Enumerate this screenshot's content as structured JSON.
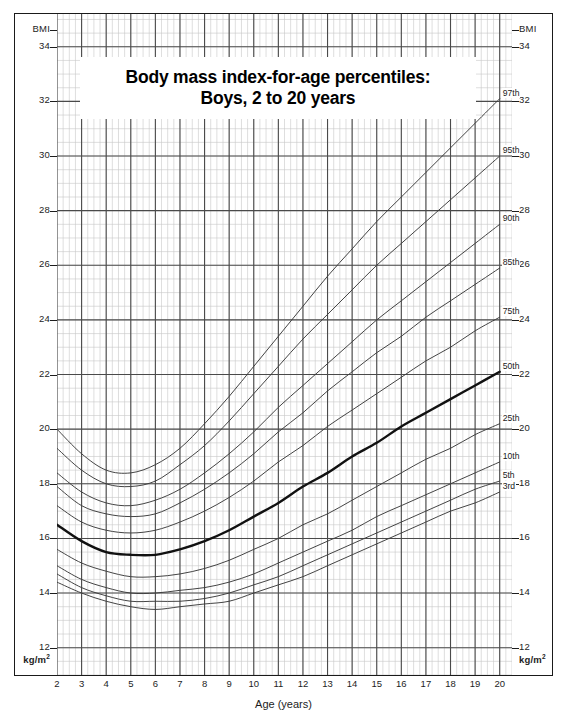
{
  "title": {
    "line1": "Body mass index-for-age percentiles:",
    "line2": "Boys, 2 to 20 years"
  },
  "axes": {
    "y_header_left": "BMI",
    "y_header_right": "BMI",
    "y_unit_left": "kg/m",
    "y_unit_right": "kg/m",
    "y_unit_sup": "2",
    "x_title": "Age (years)"
  },
  "chart_data": {
    "type": "line",
    "title": "Body mass index-for-age percentiles: Boys, 2 to 20 years",
    "xlabel": "Age (years)",
    "ylabel": "BMI",
    "yunit": "kg/m2",
    "xlim": [
      2,
      20.5
    ],
    "ylim": [
      11,
      35.2
    ],
    "xticks": [
      2,
      3,
      4,
      5,
      6,
      7,
      8,
      9,
      10,
      11,
      12,
      13,
      14,
      15,
      16,
      17,
      18,
      19,
      20
    ],
    "yticks": [
      12,
      14,
      16,
      18,
      20,
      22,
      24,
      26,
      28,
      30,
      32,
      34
    ],
    "grid": true,
    "grid_major_x": 1,
    "grid_minor_x": 0.25,
    "grid_major_y": 2,
    "grid_minor_y": 0.5,
    "legend_position": "right-inline",
    "x": [
      2,
      3,
      4,
      5,
      6,
      7,
      8,
      9,
      10,
      11,
      12,
      13,
      14,
      15,
      16,
      17,
      18,
      19,
      20
    ],
    "series": [
      {
        "name": "97th",
        "emphasis": false,
        "values": [
          20.0,
          19.1,
          18.5,
          18.4,
          18.7,
          19.3,
          20.2,
          21.2,
          22.3,
          23.4,
          24.5,
          25.6,
          26.6,
          27.6,
          28.5,
          29.4,
          30.3,
          31.2,
          32.1
        ]
      },
      {
        "name": "95th",
        "emphasis": false,
        "values": [
          19.3,
          18.5,
          18.0,
          17.9,
          18.1,
          18.7,
          19.4,
          20.3,
          21.3,
          22.3,
          23.3,
          24.2,
          25.1,
          26.0,
          26.8,
          27.6,
          28.4,
          29.2,
          30.0
        ]
      },
      {
        "name": "90th",
        "emphasis": false,
        "values": [
          18.4,
          17.7,
          17.3,
          17.2,
          17.4,
          17.8,
          18.4,
          19.1,
          19.9,
          20.8,
          21.6,
          22.4,
          23.2,
          24.0,
          24.7,
          25.4,
          26.1,
          26.8,
          27.5
        ]
      },
      {
        "name": "85th",
        "emphasis": false,
        "values": [
          17.9,
          17.2,
          16.9,
          16.8,
          16.9,
          17.3,
          17.8,
          18.4,
          19.1,
          19.9,
          20.6,
          21.4,
          22.1,
          22.8,
          23.4,
          24.1,
          24.7,
          25.3,
          25.9
        ]
      },
      {
        "name": "75th",
        "emphasis": false,
        "values": [
          17.2,
          16.6,
          16.3,
          16.2,
          16.3,
          16.6,
          17.0,
          17.5,
          18.1,
          18.8,
          19.4,
          20.1,
          20.7,
          21.3,
          21.9,
          22.5,
          23.0,
          23.6,
          24.1
        ]
      },
      {
        "name": "50th",
        "emphasis": true,
        "values": [
          16.5,
          15.9,
          15.5,
          15.4,
          15.4,
          15.6,
          15.9,
          16.3,
          16.8,
          17.3,
          17.9,
          18.4,
          19.0,
          19.5,
          20.1,
          20.6,
          21.1,
          21.6,
          22.1
        ]
      },
      {
        "name": "25th",
        "emphasis": false,
        "values": [
          15.6,
          15.1,
          14.8,
          14.6,
          14.6,
          14.7,
          14.9,
          15.2,
          15.6,
          16.0,
          16.5,
          16.9,
          17.4,
          17.9,
          18.4,
          18.9,
          19.3,
          19.8,
          20.2
        ]
      },
      {
        "name": "10th",
        "emphasis": false,
        "values": [
          15.0,
          14.5,
          14.2,
          14.0,
          14.0,
          14.1,
          14.2,
          14.4,
          14.7,
          15.1,
          15.5,
          15.9,
          16.3,
          16.8,
          17.2,
          17.6,
          18.0,
          18.4,
          18.8
        ]
      },
      {
        "name": "5th",
        "emphasis": false,
        "values": [
          14.7,
          14.2,
          13.9,
          13.7,
          13.7,
          13.7,
          13.8,
          14.0,
          14.3,
          14.6,
          15.0,
          15.4,
          15.8,
          16.2,
          16.6,
          17.0,
          17.4,
          17.8,
          18.1
        ]
      },
      {
        "name": "3rd",
        "emphasis": false,
        "values": [
          14.4,
          14.0,
          13.7,
          13.5,
          13.4,
          13.5,
          13.6,
          13.7,
          14.0,
          14.3,
          14.6,
          15.0,
          15.4,
          15.8,
          16.2,
          16.6,
          17.0,
          17.3,
          17.7
        ]
      }
    ]
  },
  "colors": {
    "grid_major": "#4a4a4a",
    "grid_minor": "#c8c8c8",
    "curve": "#3a3a3a",
    "curve_emphasis": "#111111",
    "frame": "#1a1a1a",
    "text": "#1d1d1d"
  }
}
